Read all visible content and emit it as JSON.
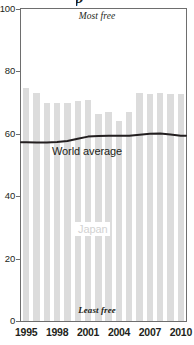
{
  "chart_data": {
    "type": "bar",
    "title": "",
    "xlabel": "",
    "ylabel": "",
    "ylim": [
      0,
      100
    ],
    "xlim": [
      1995,
      2010
    ],
    "grid": false,
    "legend_position": "inline-annotations",
    "categories": [
      "1995",
      "1996",
      "1997",
      "1998",
      "1999",
      "2000",
      "2001",
      "2002",
      "2003",
      "2004",
      "2005",
      "2006",
      "2007",
      "2008",
      "2009",
      "2010"
    ],
    "series": [
      {
        "name": "Japan",
        "type": "bar",
        "color": "#dcdcdc",
        "values": [
          74.7,
          73.0,
          70.0,
          70.0,
          70.0,
          70.5,
          70.8,
          66.5,
          67.0,
          64.0,
          67.0,
          73.0,
          72.8,
          73.0,
          72.8,
          72.7
        ]
      },
      {
        "name": "World average",
        "type": "line",
        "color": "#231f20",
        "values": [
          57.3,
          57.2,
          57.2,
          57.4,
          57.7,
          58.4,
          59.1,
          59.3,
          59.4,
          59.4,
          59.4,
          59.7,
          60.0,
          60.1,
          59.8,
          59.4
        ]
      }
    ],
    "y_ticks": [
      "0",
      "20",
      "40",
      "60",
      "80",
      "100"
    ],
    "y_tick_values": [
      0,
      20,
      40,
      60,
      80,
      100
    ],
    "x_ticks": [
      "1995",
      "1998",
      "2001",
      "2004",
      "2007",
      "2010"
    ],
    "x_tick_values": [
      1995,
      1998,
      2001,
      2004,
      2007,
      2010
    ],
    "annotations": {
      "top": "Most free",
      "bottom": "Least free",
      "line_label": "World average",
      "bar_label": "Japan"
    },
    "colors": {
      "bar": "#dcdcdc",
      "line": "#231f20",
      "axis": "#6e6e6e",
      "text": "#231f20",
      "bar_label_text": "#d2d2d2",
      "background": "#ffffff"
    },
    "title_fragment_cropped": "p"
  }
}
